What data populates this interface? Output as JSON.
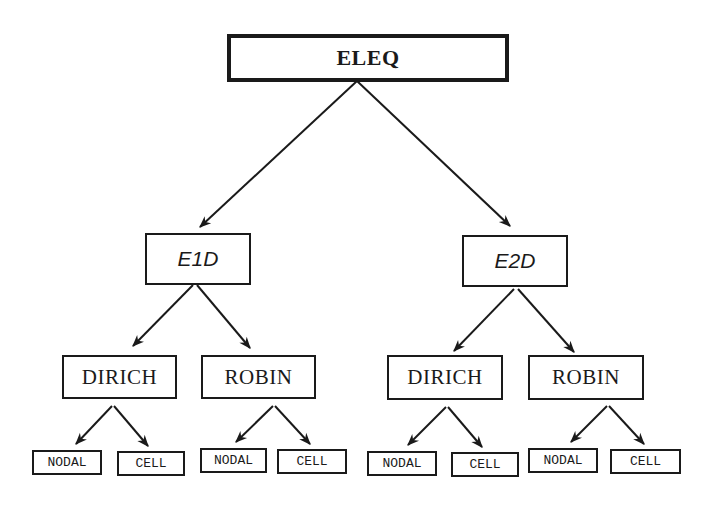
{
  "diagram": {
    "type": "tree",
    "root": {
      "id": "eleq",
      "label": "ELEQ"
    },
    "level1": [
      {
        "id": "e1d",
        "label": "E1D"
      },
      {
        "id": "e2d",
        "label": "E2D"
      }
    ],
    "level2": [
      {
        "id": "e1d-dirich",
        "label": "DIRICH",
        "parent": "e1d"
      },
      {
        "id": "e1d-robin",
        "label": "ROBIN",
        "parent": "e1d"
      },
      {
        "id": "e2d-dirich",
        "label": "DIRICH",
        "parent": "e2d"
      },
      {
        "id": "e2d-robin",
        "label": "ROBIN",
        "parent": "e2d"
      }
    ],
    "level3": [
      {
        "id": "e1d-dirich-nodal",
        "label": "NODAL",
        "parent": "e1d-dirich"
      },
      {
        "id": "e1d-dirich-cell",
        "label": "CELL",
        "parent": "e1d-dirich"
      },
      {
        "id": "e1d-robin-nodal",
        "label": "NODAL",
        "parent": "e1d-robin"
      },
      {
        "id": "e1d-robin-cell",
        "label": "CELL",
        "parent": "e1d-robin"
      },
      {
        "id": "e2d-dirich-nodal",
        "label": "NODAL",
        "parent": "e2d-dirich"
      },
      {
        "id": "e2d-dirich-cell",
        "label": "CELL",
        "parent": "e2d-dirich"
      },
      {
        "id": "e2d-robin-nodal",
        "label": "NODAL",
        "parent": "e2d-robin"
      },
      {
        "id": "e2d-robin-cell",
        "label": "CELL",
        "parent": "e2d-robin"
      }
    ],
    "edges": [
      [
        "eleq",
        "e1d"
      ],
      [
        "eleq",
        "e2d"
      ],
      [
        "e1d",
        "e1d-dirich"
      ],
      [
        "e1d",
        "e1d-robin"
      ],
      [
        "e2d",
        "e2d-dirich"
      ],
      [
        "e2d",
        "e2d-robin"
      ],
      [
        "e1d-dirich",
        "e1d-dirich-nodal"
      ],
      [
        "e1d-dirich",
        "e1d-dirich-cell"
      ],
      [
        "e1d-robin",
        "e1d-robin-nodal"
      ],
      [
        "e1d-robin",
        "e1d-robin-cell"
      ],
      [
        "e2d-dirich",
        "e2d-dirich-nodal"
      ],
      [
        "e2d-dirich",
        "e2d-dirich-cell"
      ],
      [
        "e2d-robin",
        "e2d-robin-nodal"
      ],
      [
        "e2d-robin",
        "e2d-robin-cell"
      ]
    ],
    "colors": {
      "stroke": "#1a1a1a",
      "background": "#ffffff"
    }
  }
}
